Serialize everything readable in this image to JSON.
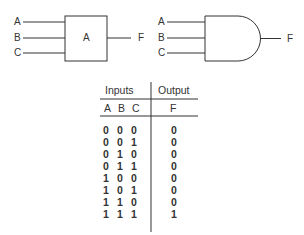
{
  "block_diagram": {
    "inputs": [
      "A",
      "B",
      "C"
    ],
    "block_label": "A",
    "output": "F"
  },
  "and_gate": {
    "inputs": [
      "A",
      "B",
      "C"
    ],
    "output": "F"
  },
  "truth_table": {
    "group_headers": {
      "inputs": "Inputs",
      "output": "Output"
    },
    "columns": [
      "A",
      "B",
      "C",
      "F"
    ],
    "rows": [
      [
        "0",
        "0",
        "0",
        "0"
      ],
      [
        "0",
        "0",
        "1",
        "0"
      ],
      [
        "0",
        "1",
        "0",
        "0"
      ],
      [
        "0",
        "1",
        "1",
        "0"
      ],
      [
        "1",
        "0",
        "0",
        "0"
      ],
      [
        "1",
        "0",
        "1",
        "0"
      ],
      [
        "1",
        "1",
        "0",
        "0"
      ],
      [
        "1",
        "1",
        "1",
        "1"
      ]
    ]
  }
}
